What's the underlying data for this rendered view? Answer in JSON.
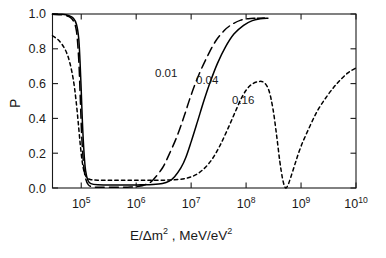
{
  "chart_data": {
    "type": "line",
    "title": "",
    "xlabel": "E/Δm² , MeV/eV²",
    "ylabel": "P",
    "xscale": "log",
    "yscale": "linear",
    "xlim": [
      30000,
      10000000000
    ],
    "ylim": [
      0.0,
      1.0
    ],
    "grid": false,
    "legend_position": "inline-annotations",
    "x_ticks": [
      {
        "value": 100000,
        "label_mantissa": "10",
        "label_exponent": "5"
      },
      {
        "value": 1000000,
        "label_mantissa": "10",
        "label_exponent": "6"
      },
      {
        "value": 10000000,
        "label_mantissa": "10",
        "label_exponent": "7"
      },
      {
        "value": 100000000,
        "label_mantissa": "10",
        "label_exponent": "8"
      },
      {
        "value": 1000000000,
        "label_mantissa": "10",
        "label_exponent": "9"
      },
      {
        "value": 10000000000,
        "label_mantissa": "10",
        "label_exponent": "10"
      }
    ],
    "y_ticks": [
      "0.0",
      "0.2",
      "0.4",
      "0.6",
      "0.8",
      "1.0"
    ],
    "series": [
      {
        "name": "0.01",
        "label": "0.01",
        "style": "long-dash",
        "color": "#000000",
        "points": [
          [
            30000,
            0.998
          ],
          [
            45000,
            0.995
          ],
          [
            60000,
            0.985
          ],
          [
            72000,
            0.96
          ],
          [
            82000,
            0.9
          ],
          [
            90000,
            0.74
          ],
          [
            96000,
            0.52
          ],
          [
            102000,
            0.3
          ],
          [
            110000,
            0.14
          ],
          [
            120000,
            0.055
          ],
          [
            135000,
            0.018
          ],
          [
            160000,
            0.007
          ],
          [
            220000,
            0.004
          ],
          [
            400000,
            0.004
          ],
          [
            700000,
            0.005
          ],
          [
            1000000,
            0.007
          ],
          [
            1500000,
            0.02
          ],
          [
            2000000,
            0.045
          ],
          [
            3000000,
            0.115
          ],
          [
            4000000,
            0.195
          ],
          [
            5500000,
            0.295
          ],
          [
            7500000,
            0.415
          ],
          [
            10000000,
            0.535
          ],
          [
            14000000,
            0.655
          ],
          [
            20000000,
            0.76
          ],
          [
            28000000,
            0.845
          ],
          [
            40000000,
            0.905
          ],
          [
            55000000,
            0.94
          ],
          [
            80000000,
            0.965
          ],
          [
            110000000,
            0.973
          ],
          [
            145000000,
            0.976
          ]
        ]
      },
      {
        "name": "0.04",
        "label": "0.04",
        "style": "solid",
        "color": "#000000",
        "points": [
          [
            30000,
            1.0
          ],
          [
            45000,
            0.998
          ],
          [
            60000,
            0.99
          ],
          [
            72000,
            0.975
          ],
          [
            82000,
            0.94
          ],
          [
            90000,
            0.86
          ],
          [
            95000,
            0.73
          ],
          [
            100000,
            0.56
          ],
          [
            105000,
            0.38
          ],
          [
            112000,
            0.21
          ],
          [
            120000,
            0.1
          ],
          [
            132000,
            0.045
          ],
          [
            150000,
            0.025
          ],
          [
            200000,
            0.018
          ],
          [
            350000,
            0.017
          ],
          [
            700000,
            0.017
          ],
          [
            1200000,
            0.018
          ],
          [
            2000000,
            0.02
          ],
          [
            3000000,
            0.026
          ],
          [
            4000000,
            0.04
          ],
          [
            5000000,
            0.065
          ],
          [
            6500000,
            0.115
          ],
          [
            8000000,
            0.175
          ],
          [
            10000000,
            0.265
          ],
          [
            13000000,
            0.38
          ],
          [
            17000000,
            0.5
          ],
          [
            22000000,
            0.605
          ],
          [
            30000000,
            0.715
          ],
          [
            42000000,
            0.81
          ],
          [
            60000000,
            0.885
          ],
          [
            90000000,
            0.935
          ],
          [
            130000000,
            0.962
          ],
          [
            180000000,
            0.972
          ],
          [
            250000000,
            0.976
          ]
        ]
      },
      {
        "name": "0.16",
        "label": "0.16",
        "style": "short-dash",
        "color": "#000000",
        "points": [
          [
            30000,
            0.875
          ],
          [
            40000,
            0.845
          ],
          [
            52000,
            0.79
          ],
          [
            62000,
            0.72
          ],
          [
            72000,
            0.62
          ],
          [
            80000,
            0.51
          ],
          [
            88000,
            0.38
          ],
          [
            96000,
            0.25
          ],
          [
            105000,
            0.145
          ],
          [
            115000,
            0.085
          ],
          [
            128000,
            0.058
          ],
          [
            150000,
            0.048
          ],
          [
            200000,
            0.045
          ],
          [
            350000,
            0.044
          ],
          [
            700000,
            0.044
          ],
          [
            1500000,
            0.044
          ],
          [
            3000000,
            0.045
          ],
          [
            5000000,
            0.047
          ],
          [
            8000000,
            0.055
          ],
          [
            12000000,
            0.075
          ],
          [
            17000000,
            0.11
          ],
          [
            24000000,
            0.165
          ],
          [
            33000000,
            0.24
          ],
          [
            45000000,
            0.33
          ],
          [
            62000000,
            0.43
          ],
          [
            85000000,
            0.525
          ],
          [
            115000000,
            0.585
          ],
          [
            160000000,
            0.61
          ],
          [
            210000000,
            0.607
          ],
          [
            260000000,
            0.56
          ],
          [
            310000000,
            0.45
          ],
          [
            360000000,
            0.3
          ],
          [
            410000000,
            0.155
          ],
          [
            460000000,
            0.055
          ],
          [
            510000000,
            0.005
          ],
          [
            560000000,
            0.008
          ],
          [
            640000000,
            0.055
          ],
          [
            780000000,
            0.14
          ],
          [
            1000000000,
            0.24
          ],
          [
            1400000000,
            0.345
          ],
          [
            2000000000,
            0.445
          ],
          [
            3000000000,
            0.53
          ],
          [
            4500000000,
            0.6
          ],
          [
            7000000000,
            0.66
          ],
          [
            10000000000,
            0.69
          ]
        ]
      }
    ],
    "annotations": [
      {
        "text": "0.01",
        "x_px": 155,
        "y_px": 68
      },
      {
        "text": "0.04",
        "x_px": 196,
        "y_px": 75
      },
      {
        "text": "0.16",
        "x_px": 232,
        "y_px": 95
      }
    ]
  },
  "axis_title_parts": {
    "x_main": "E/Δm",
    "x_sup1": "2",
    "x_mid": " , MeV/eV",
    "x_sup2": "2",
    "y": "P"
  }
}
